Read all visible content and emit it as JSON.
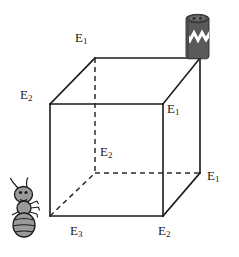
{
  "figure": {
    "background_color": "#ffffff",
    "line_color": "#1a1a1a",
    "dash_color": "#2b2b2b",
    "ant_color": "#9a9a9a",
    "ant_outline": "#1a1a1a",
    "container_color": "#5a5a5a",
    "container_dark": "#3f3f3f",
    "container_band": "#ffffff"
  },
  "labels": [
    {
      "name": "label-top-back",
      "base": "E",
      "sub": "1",
      "x": 75,
      "y": 31
    },
    {
      "name": "label-left-top",
      "base": "E",
      "sub": "2",
      "x": 20,
      "y": 88
    },
    {
      "name": "label-right-upper",
      "base": "E",
      "sub": "1",
      "x": 167,
      "y": 102
    },
    {
      "name": "label-center-hidden",
      "base": "E",
      "sub": "2",
      "x": 100,
      "y": 145
    },
    {
      "name": "label-right-lower",
      "base": "E",
      "sub": "1",
      "x": 207,
      "y": 169
    },
    {
      "name": "label-bottom-left",
      "base": "E",
      "sub": "3",
      "x": 70,
      "y": 224
    },
    {
      "name": "label-bottom-right",
      "base": "E",
      "sub": "2",
      "x": 158,
      "y": 224
    }
  ],
  "cube": {
    "vertices": {
      "front_top_left": {
        "x": 50,
        "y": 104
      },
      "front_top_right": {
        "x": 163,
        "y": 104
      },
      "front_bottom_left": {
        "x": 50,
        "y": 216
      },
      "front_bottom_right": {
        "x": 163,
        "y": 216
      },
      "back_top_left": {
        "x": 95,
        "y": 58
      },
      "back_top_right": {
        "x": 200,
        "y": 58
      },
      "back_bottom_left": {
        "x": 95,
        "y": 173
      },
      "back_bottom_right": {
        "x": 200,
        "y": 173
      }
    },
    "solid_edges": 9,
    "dashed_edges": 3
  },
  "objects": {
    "ant": {
      "name": "ant",
      "x": 8,
      "y": 180,
      "width": 42,
      "height": 58
    },
    "container": {
      "name": "container-jar",
      "x": 185,
      "y": 10,
      "width": 26,
      "height": 48,
      "band": "zigzag"
    }
  }
}
